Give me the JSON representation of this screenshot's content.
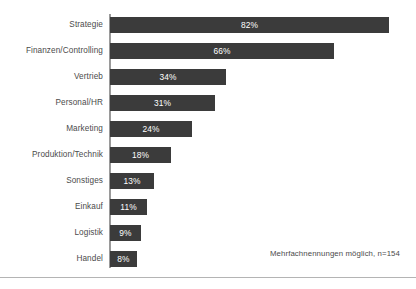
{
  "chart_data": {
    "type": "bar",
    "orientation": "horizontal",
    "title": "",
    "subtitle": "",
    "xlabel": "",
    "ylabel": "",
    "xlim": [
      0,
      90
    ],
    "grid": false,
    "legend": null,
    "value_suffix": "%",
    "categories": [
      "Strategie",
      "Finanzen/Controlling",
      "Vertrieb",
      "Personal/HR",
      "Marketing",
      "Produktion/Technik",
      "Sonstiges",
      "Einkauf",
      "Logistik",
      "Handel"
    ],
    "values": [
      82,
      66,
      34,
      31,
      24,
      18,
      13,
      11,
      9,
      8
    ],
    "value_labels": [
      "82%",
      "66%",
      "34%",
      "31%",
      "24%",
      "18%",
      "13%",
      "11%",
      "9%",
      "8%"
    ],
    "annotations": [
      "Mehrfachnennungen möglich, n=154"
    ],
    "colors": {
      "bar": "#3b3b3b",
      "bar_value_text": "#ffffff",
      "category_label_text": "#4b4b4b",
      "axis_line": "#9a9a9a",
      "background": "#ffffff",
      "divider": "#b4b4b4"
    }
  },
  "footnote": {
    "text": "Mehrfachnennungen möglich, n=154"
  }
}
